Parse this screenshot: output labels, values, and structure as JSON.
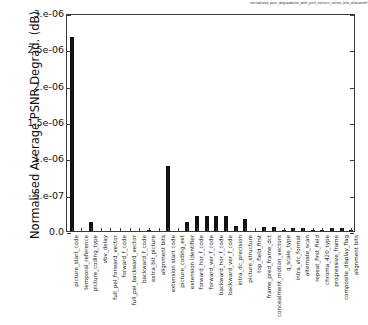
{
  "figure": {
    "title": "normalised_psnr_degradation_with_pmf_column_vector_bits_allocated*.plt",
    "ylabel": "Normalised Average PSNR Degrad. (dB)",
    "xlabel": ""
  },
  "axes": {
    "y_ticks": [
      "0.0",
      "5.e-07",
      "1.e-06",
      "1.5e-06",
      "2.e-06",
      "2.5e-06",
      "3.e-06"
    ],
    "y_tick_values": [
      0,
      5e-07,
      1e-06,
      1.5e-06,
      2e-06,
      2.5e-06,
      3e-06
    ],
    "ylim": [
      0,
      3e-06
    ]
  },
  "chart_data": {
    "type": "bar",
    "title": "normalised_psnr_degradation_with_pmf_column_vector_bits_allocated*.plt",
    "xlabel": "",
    "ylabel": "Normalised Average PSNR Degrad. (dB)",
    "ylim": [
      0,
      3e-06
    ],
    "grid": false,
    "legend": false,
    "categories": [
      "picture_start_code",
      "temporal_reference",
      "picture_coding_type",
      "vbv_delay",
      "full_pel_forward_vector",
      "forward_f_code",
      "full_pel_backward_vector",
      "backward_f_code",
      "extra_bit_picture",
      "alignment bits",
      "extension start code",
      "picture_coding_ext",
      "extension identifier",
      "forward_hor_f_code",
      "forward_ver_f_code",
      "backward_hor_f_code",
      "backward_ver_f_code",
      "intra_dc_precision",
      "picture_structure",
      "top_field_first",
      "frame_pred_frame_dct",
      "concealment_motion_vectors",
      "q_scale_type",
      "intra_vlc_format",
      "alternate_scan",
      "repeat_first_field",
      "chroma_420_type",
      "progressive_frame",
      "composite_display_flag",
      "alignment bits"
    ],
    "values": [
      2.67e-06,
      0.0,
      1.3e-07,
      0.0,
      0.0,
      0.0,
      0.0,
      0.0,
      1.5e-08,
      0.0,
      9e-07,
      0.0,
      1.2e-07,
      2e-07,
      2e-07,
      2.1e-07,
      2.1e-07,
      7e-08,
      1.6e-07,
      0.0,
      6e-08,
      6e-08,
      1.5e-08,
      4e-08,
      4e-08,
      1e-08,
      1e-08,
      4e-08,
      4.5e-08,
      1e-08
    ],
    "bar_color": "#111111"
  }
}
